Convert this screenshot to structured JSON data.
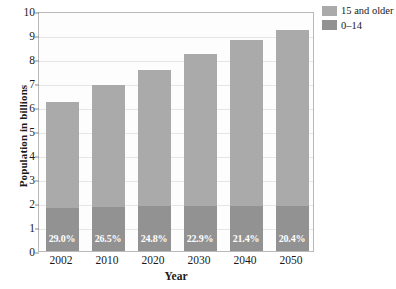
{
  "chart_data": {
    "type": "bar",
    "stacked": true,
    "title": "",
    "xlabel": "Year",
    "ylabel": "Population in billions",
    "categories": [
      "2002",
      "2010",
      "2020",
      "2030",
      "2040",
      "2050"
    ],
    "ylim": [
      0,
      10
    ],
    "yticks": [
      "0",
      "1",
      "2",
      "3",
      "4",
      "5",
      "6",
      "7",
      "8",
      "9",
      "10"
    ],
    "grid": true,
    "legend_position": "top-right",
    "series": [
      {
        "name": "15 and older",
        "color": "#aaaaaa",
        "values": [
          4.4,
          5.07,
          5.68,
          6.32,
          6.91,
          7.32
        ]
      },
      {
        "name": "0–14",
        "color": "#929292",
        "values": [
          1.8,
          1.83,
          1.87,
          1.88,
          1.89,
          1.88
        ]
      }
    ],
    "totals": [
      6.2,
      6.9,
      7.55,
      8.2,
      8.8,
      9.2
    ],
    "point_labels": [
      "29.0%",
      "26.5%",
      "24.8%",
      "22.9%",
      "21.4%",
      "20.4%"
    ],
    "label_note": "percent of population aged 0–14"
  },
  "legend": {
    "items": [
      {
        "label": "15 and older",
        "color": "#aaaaaa"
      },
      {
        "label": "0–14",
        "color": "#929292"
      }
    ]
  }
}
